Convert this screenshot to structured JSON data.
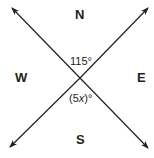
{
  "diagram": {
    "directions": {
      "north": "N",
      "south": "S",
      "east": "E",
      "west": "W"
    },
    "angles": {
      "top": "115°",
      "bottom_prefix": "(5",
      "bottom_var": "x",
      "bottom_suffix": ")°"
    },
    "line_color": "#231f20"
  }
}
